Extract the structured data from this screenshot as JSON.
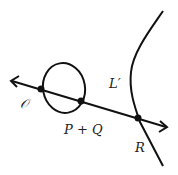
{
  "diagram": {
    "title": "",
    "labels": {
      "origin": "𝒪",
      "sum": "P + Q",
      "curve": "L′",
      "point_r": "R"
    },
    "nodes": [
      {
        "id": "O",
        "label": "𝒪"
      },
      {
        "id": "PQ",
        "label": "P + Q"
      },
      {
        "id": "R",
        "label": "R"
      }
    ],
    "curves": [
      {
        "id": "oval",
        "type": "closed loop"
      },
      {
        "id": "L-prime",
        "label": "L′",
        "type": "open branch"
      },
      {
        "id": "line",
        "type": "line with arrows both ends",
        "passes_through": [
          "O",
          "PQ",
          "R"
        ]
      }
    ],
    "colors": {
      "stroke": "#111111",
      "background": "#ffffff"
    }
  }
}
